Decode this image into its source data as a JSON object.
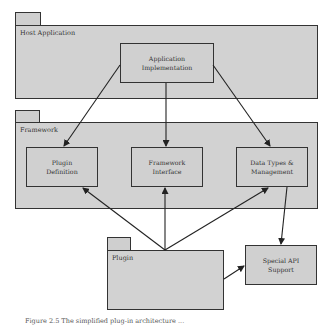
{
  "diagram": {
    "packages": {
      "host": {
        "label": "Host Application"
      },
      "framework": {
        "label": "Framework"
      },
      "plugin": {
        "label": "Plugin"
      }
    },
    "boxes": {
      "app_impl": {
        "line1": "Application",
        "line2": "Implementation"
      },
      "plugin_def": {
        "line1": "Plugin",
        "line2": "Definition"
      },
      "framework_iface": {
        "line1": "Framework",
        "line2": "Interface"
      },
      "data_types": {
        "line1": "Data Types &",
        "line2": "Management"
      },
      "special_api": {
        "line1": "Special API",
        "line2": "Support"
      }
    },
    "edges": [
      {
        "from": "Application Implementation",
        "to": "Plugin Definition"
      },
      {
        "from": "Application Implementation",
        "to": "Framework Interface"
      },
      {
        "from": "Application Implementation",
        "to": "Data Types & Management"
      },
      {
        "from": "Plugin",
        "to": "Plugin Definition"
      },
      {
        "from": "Plugin",
        "to": "Framework Interface"
      },
      {
        "from": "Plugin",
        "to": "Data Types & Management"
      },
      {
        "from": "Data Types & Management",
        "to": "Special API Support"
      },
      {
        "from": "Plugin",
        "to": "Special API Support"
      }
    ],
    "colors": {
      "fill": "#d0d0d0",
      "stroke": "#333333"
    }
  },
  "caption": {
    "text": "Figure 2.5  The simplified plug-in architecture ..."
  }
}
